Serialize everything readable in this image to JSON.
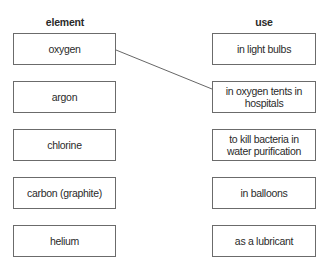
{
  "headers": {
    "left": "element",
    "right": "use"
  },
  "elements": [
    {
      "label": "oxygen"
    },
    {
      "label": "argon"
    },
    {
      "label": "chlorine"
    },
    {
      "label": "carbon (graphite)"
    },
    {
      "label": "helium"
    }
  ],
  "uses": [
    {
      "label": "in light bulbs"
    },
    {
      "label": "in oxygen tents in hospitals"
    },
    {
      "label": "to kill bacteria in water purification"
    },
    {
      "label": "in balloons"
    },
    {
      "label": "as a lubricant"
    }
  ],
  "connections": [
    {
      "from": "oxygen",
      "to": "in oxygen tents in hospitals"
    }
  ],
  "colors": {
    "border": "#6b6b6b",
    "line": "#555555",
    "text": "#2a2a2a"
  }
}
